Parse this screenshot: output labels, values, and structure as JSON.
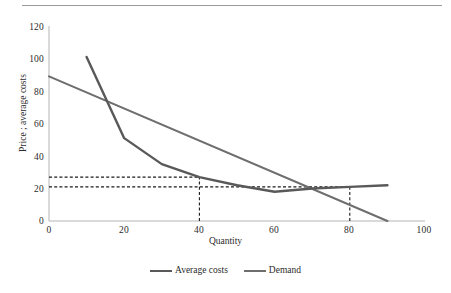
{
  "chart_data": {
    "type": "line",
    "title": "",
    "xlabel": "Quantity",
    "ylabel": "Price ; average costs",
    "xlim": [
      0,
      100
    ],
    "ylim": [
      0,
      120
    ],
    "xticks": [
      0,
      20,
      40,
      60,
      80,
      100
    ],
    "yticks": [
      0,
      20,
      40,
      60,
      80,
      100,
      120
    ],
    "grid": false,
    "legend_position": "bottom-center",
    "series": [
      {
        "name": "Average costs",
        "color": "#595959",
        "x": [
          10,
          20,
          30,
          40,
          50,
          60,
          70,
          80,
          90
        ],
        "y": [
          101,
          51,
          35,
          27,
          22,
          18,
          20,
          21,
          22
        ]
      },
      {
        "name": "Demand",
        "color": "#6e6e6e",
        "x": [
          0,
          90
        ],
        "y": [
          89,
          0
        ]
      }
    ],
    "annotations": [
      {
        "type": "dashed-horizontal",
        "label": "average-cost-price-line",
        "y": 27,
        "x_from": 0,
        "x_to": 40,
        "color": "#1a1a1a"
      },
      {
        "type": "dashed-horizontal",
        "label": "regulated-price-line",
        "y": 21,
        "x_from": 0,
        "x_to": 80,
        "color": "#1a1a1a"
      },
      {
        "type": "dashed-vertical",
        "label": "quantity-40-line",
        "x": 40,
        "y_from": 0,
        "y_to": 27,
        "color": "#1a1a1a"
      },
      {
        "type": "dashed-vertical",
        "label": "quantity-80-line",
        "x": 80,
        "y_from": 0,
        "y_to": 21,
        "color": "#1a1a1a"
      }
    ]
  },
  "axis": {
    "x_title": "Quantity",
    "y_title": "Price ; average costs",
    "x_tick_labels": [
      "0",
      "20",
      "40",
      "60",
      "80",
      "100"
    ],
    "y_tick_labels": [
      "0",
      "20",
      "40",
      "60",
      "80",
      "100",
      "120"
    ]
  },
  "legend": {
    "items": [
      {
        "label": "Average costs",
        "color": "#595959"
      },
      {
        "label": "Demand",
        "color": "#6e6e6e"
      }
    ]
  },
  "colors": {
    "average_costs": "#595959",
    "demand": "#6e6e6e",
    "axis": "#b5b5b5",
    "dashed": "#1a1a1a",
    "top_rule": "#9a9a9a",
    "text": "#2b2b2b"
  }
}
